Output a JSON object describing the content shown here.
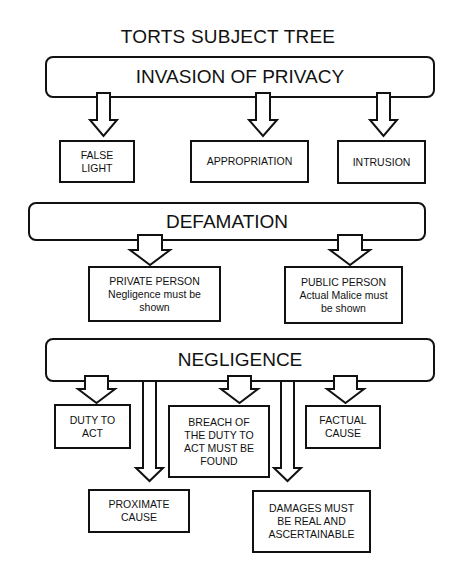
{
  "title": "TORTS SUBJECT TREE",
  "sections": [
    {
      "label": "INVASION OF PRIVACY",
      "children": [
        {
          "label": "FALSE\nLIGHT"
        },
        {
          "label": "APPROPRIATION"
        },
        {
          "label": "INTRUSION"
        }
      ]
    },
    {
      "label": "DEFAMATION",
      "children": [
        {
          "label": "PRIVATE PERSON\nNegligence must be\nshown"
        },
        {
          "label": "PUBLIC PERSON\nActual Malice must\nbe shown"
        }
      ]
    },
    {
      "label": "NEGLIGENCE",
      "children": [
        {
          "label": "DUTY TO\nACT"
        },
        {
          "label": "BREACH OF\nTHE DUTY TO\nACT MUST BE\nFOUND"
        },
        {
          "label": "FACTUAL\nCAUSE"
        },
        {
          "label": "PROXIMATE\nCAUSE"
        },
        {
          "label": "DAMAGES MUST\nBE REAL AND\nASCERTAINABLE"
        }
      ]
    }
  ],
  "colors": {
    "stroke": "#111111",
    "background": "#ffffff"
  }
}
